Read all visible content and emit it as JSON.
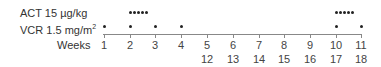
{
  "rows": [
    {
      "label": "ACT 15 µg/kg",
      "weeks_dosed": [
        2,
        10
      ],
      "pattern": "daily x5"
    },
    {
      "label_main": "VCR 1.5 mg/m",
      "label_sup": "2",
      "weeks_dosed": [
        1,
        2,
        3,
        4,
        10,
        11
      ]
    }
  ],
  "axis": {
    "label": "Weeks",
    "ticks_row1": [
      "1",
      "2",
      "3",
      "4",
      "5",
      "6",
      "7",
      "8",
      "9",
      "10",
      "11"
    ],
    "ticks_row2": [
      "",
      "",
      "",
      "",
      "12",
      "13",
      "14",
      "15",
      "16",
      "17",
      "18"
    ]
  }
}
